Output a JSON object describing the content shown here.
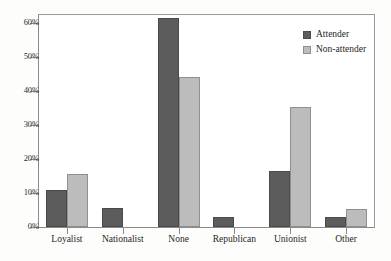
{
  "chart_data": {
    "type": "bar",
    "title": "",
    "subtitle": "",
    "xlabel": "",
    "ylabel": "",
    "categories": [
      "Loyalist",
      "Nationalist",
      "None",
      "Republican",
      "Unionist",
      "Other"
    ],
    "series": [
      {
        "name": "Attender",
        "color": "#5c5c5c",
        "values": [
          11.0,
          5.5,
          61.5,
          2.8,
          16.5,
          2.8
        ]
      },
      {
        "name": "Non-attender",
        "color": "#bcbcbc",
        "values": [
          15.7,
          0,
          44.0,
          0,
          35.3,
          5.4
        ]
      }
    ],
    "ylim": [
      0,
      65
    ],
    "ytick_values": [
      0,
      10,
      20,
      30,
      40,
      50,
      60
    ],
    "ytick_labels": [
      "0%",
      "10%",
      "20%",
      "30%",
      "40%",
      "50%",
      "60%"
    ],
    "grid": false,
    "legend_position": "top-right",
    "legend_entries": [
      "Attender",
      "Non-attender"
    ]
  },
  "axes": {
    "y_labels": [
      "60%",
      "50%",
      "40%",
      "30%",
      "20%",
      "10%",
      "0%"
    ],
    "x_labels": [
      "Loyalist",
      "Nationalist",
      "None",
      "Republican",
      "Unionist",
      "Other"
    ]
  },
  "legend": {
    "entries": [
      {
        "label": "Attender",
        "swatch": "attender"
      },
      {
        "label": "Non-attender",
        "swatch": "nonattender"
      }
    ]
  }
}
